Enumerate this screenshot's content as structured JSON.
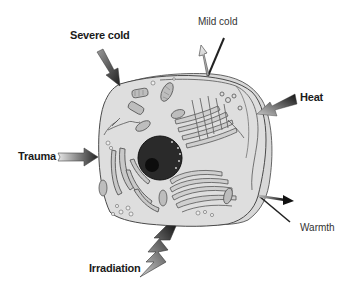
{
  "diagram": {
    "stimuli": [
      {
        "id": "severe-cold",
        "label": "Severe cold",
        "weight": "bold",
        "direction": "inward"
      },
      {
        "id": "mild-cold",
        "label": "Mild cold",
        "weight": "normal",
        "direction": "outward"
      },
      {
        "id": "heat",
        "label": "Heat",
        "weight": "bold",
        "direction": "inward"
      },
      {
        "id": "trauma",
        "label": "Trauma",
        "weight": "bold",
        "direction": "inward"
      },
      {
        "id": "warmth",
        "label": "Warmth",
        "weight": "normal",
        "direction": "outward"
      },
      {
        "id": "irradiation",
        "label": "Irradiation",
        "weight": "bold",
        "direction": "inward"
      }
    ]
  },
  "colors": {
    "cytoplasm": "#dcdcdc",
    "membrane": "#555555",
    "nucleus": "#2a2a2a",
    "nucleolus": "#0d0d0d",
    "arrow_dark": "#222222",
    "arrow_light": "#bdbdbd",
    "label_text": "#1a1a1a"
  }
}
